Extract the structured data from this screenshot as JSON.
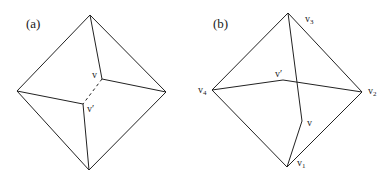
{
  "figure": {
    "panel_a": {
      "label": "(a)",
      "vertex_labels": {
        "v": "v",
        "v_prime": "v′"
      }
    },
    "panel_b": {
      "label": "(b)",
      "vertex_labels": {
        "v1": "v",
        "v1_sub": "1",
        "v2": "v",
        "v2_sub": "2",
        "v3": "v",
        "v3_sub": "3",
        "v4": "v",
        "v4_sub": "4",
        "v": "v",
        "v_prime": "v′"
      }
    },
    "colors": {
      "stroke": "#222222",
      "background": "#ffffff"
    }
  }
}
